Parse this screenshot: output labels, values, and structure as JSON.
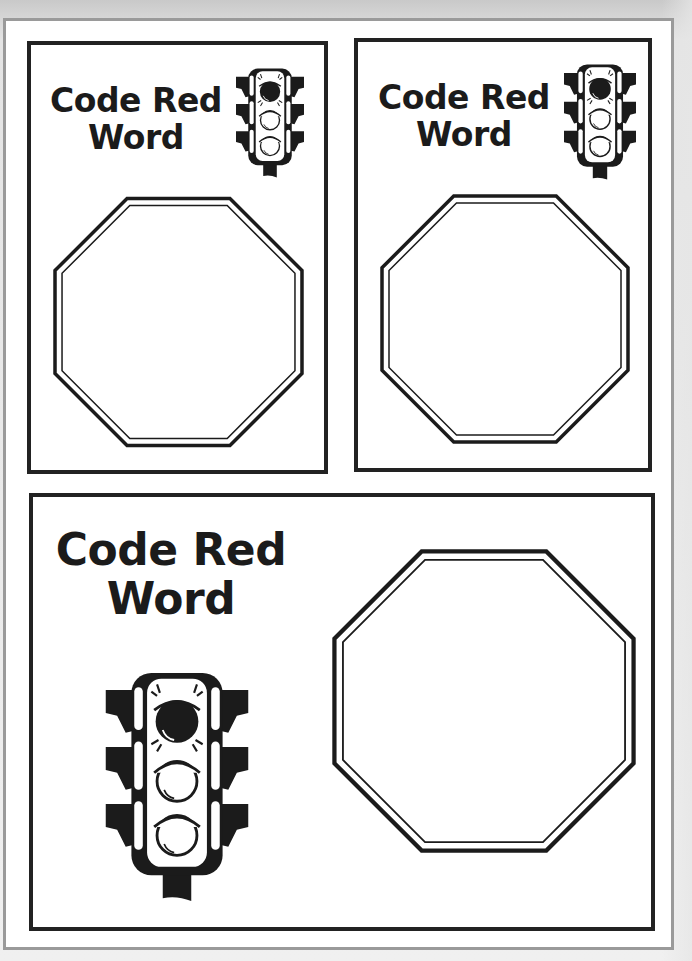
{
  "worksheet": {
    "colors": {
      "ink": "#1b1b1b",
      "card_border": "#222222",
      "sheet_border": "#9a9a9a",
      "background": "#ffffff"
    },
    "cards": [
      {
        "id": "small-card-left",
        "title_line1": "Code Red",
        "title_line2": "Word",
        "icon": "traffic-light-icon",
        "answer_shape": "stop-sign-octagon"
      },
      {
        "id": "small-card-right",
        "title_line1": "Code Red",
        "title_line2": "Word",
        "icon": "traffic-light-icon",
        "answer_shape": "stop-sign-octagon"
      },
      {
        "id": "large-card-bottom",
        "title_line1": "Code Red",
        "title_line2": "Word",
        "icon": "traffic-light-icon",
        "answer_shape": "stop-sign-octagon"
      }
    ]
  }
}
